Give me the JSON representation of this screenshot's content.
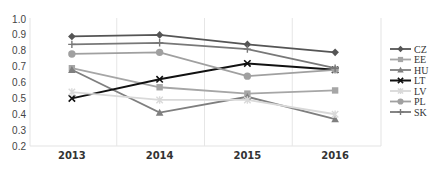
{
  "chart_data": {
    "type": "line",
    "title": "",
    "xlabel": "",
    "ylabel": "",
    "ylim": [
      0.2,
      1.0
    ],
    "yticks": [
      "1.0",
      "0.9",
      "0.8",
      "0.7",
      "0.6",
      "0.5",
      "0.4",
      "0.3",
      "0.2"
    ],
    "grid": "vertical",
    "legend_position": "right",
    "categories": [
      "2013",
      "2014",
      "2015",
      "2016"
    ],
    "series": [
      {
        "name": "CZ",
        "marker": "diamond",
        "color": "#555555",
        "values": [
          0.89,
          0.9,
          0.84,
          0.79
        ]
      },
      {
        "name": "EE",
        "marker": "square",
        "color": "#a6a6a6",
        "values": [
          0.69,
          0.57,
          0.53,
          0.55
        ]
      },
      {
        "name": "HU",
        "marker": "triangle",
        "color": "#7f7f7f",
        "values": [
          0.68,
          0.41,
          0.51,
          0.37
        ]
      },
      {
        "name": "LT",
        "marker": "x",
        "color": "#111111",
        "values": [
          0.5,
          0.62,
          0.72,
          0.68
        ]
      },
      {
        "name": "LV",
        "marker": "star",
        "color": "#d9d9d9",
        "values": [
          0.54,
          0.49,
          0.49,
          0.4
        ]
      },
      {
        "name": "PL",
        "marker": "circle",
        "color": "#a0a0a0",
        "values": [
          0.78,
          0.79,
          0.64,
          0.68
        ]
      },
      {
        "name": "SK",
        "marker": "plus",
        "color": "#787878",
        "values": [
          0.84,
          0.85,
          0.81,
          0.69
        ]
      }
    ]
  }
}
